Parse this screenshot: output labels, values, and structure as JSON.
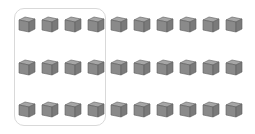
{
  "diagram": {
    "rows": 3,
    "columns": 10,
    "total_cubes": 30,
    "grouped_columns": 4,
    "grouped_cubes": 12,
    "colors": {
      "cube_top": "#a6a6a6",
      "cube_front": "#8a8a8a",
      "cube_side": "#7a7a7a",
      "cube_edge": "#5e5e5e",
      "group_border": "#d9d9d9"
    }
  }
}
